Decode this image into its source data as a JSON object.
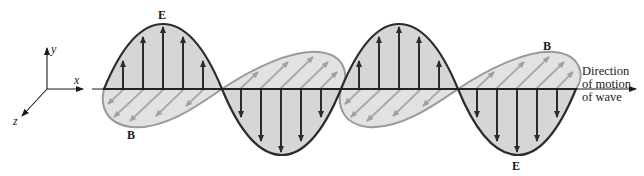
{
  "axes": {
    "x_label": "x",
    "y_label": "y",
    "z_label": "z"
  },
  "labels": {
    "e_top": "E",
    "e_bottom": "E",
    "b_left": "B",
    "b_right": "B"
  },
  "direction": {
    "line1": "Direction",
    "line2": "of motion",
    "line3": "of wave"
  },
  "colors": {
    "e_outline": "#2b2b2b",
    "e_fill": "#cfcfcf",
    "b_outline": "#9a9a9a",
    "b_fill": "#e2e2e2",
    "b_arrows": "#a8a8a8",
    "axis": "#1a1a1a"
  }
}
